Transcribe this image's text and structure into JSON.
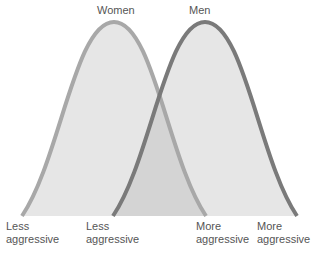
{
  "title_labels": {
    "women": "Women",
    "men": "Men"
  },
  "axis_labels": [
    {
      "line1": "Less",
      "line2": "aggressive"
    },
    {
      "line1": "Less",
      "line2": "aggressive"
    },
    {
      "line1": "More",
      "line2": "aggressive"
    },
    {
      "line1": "More",
      "line2": "aggressive"
    }
  ],
  "colors": {
    "women_stroke": "#a6a6a6",
    "men_stroke": "#777777",
    "fill": "#e4e4e4",
    "overlap_fill": "#d2d2d2"
  }
}
